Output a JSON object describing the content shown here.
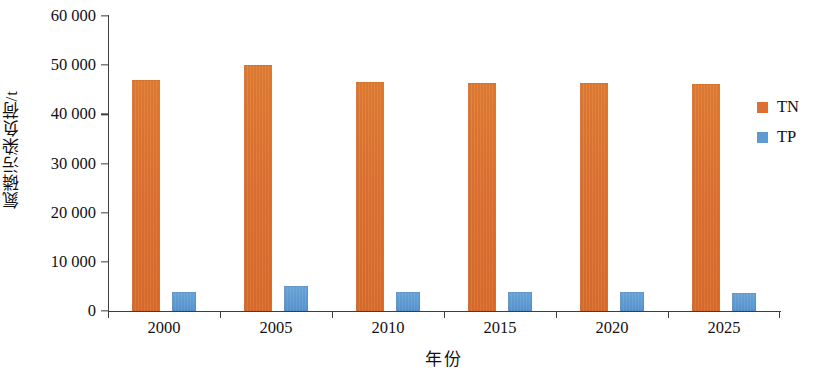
{
  "chart_data": {
    "type": "bar",
    "title": "",
    "xlabel": "年份",
    "ylabel": "氮磷污染负荷/t",
    "categories": [
      "2000",
      "2005",
      "2010",
      "2015",
      "2020",
      "2025"
    ],
    "series": [
      {
        "name": "TN",
        "color": "#dd7030",
        "values": [
          47000,
          50100,
          46500,
          46400,
          46300,
          46200
        ]
      },
      {
        "name": "TP",
        "color": "#5e9bd3",
        "values": [
          3900,
          5000,
          3900,
          3900,
          3800,
          3700
        ]
      }
    ],
    "ylim": [
      0,
      60000
    ],
    "ytick_values": [
      0,
      10000,
      20000,
      30000,
      40000,
      50000,
      60000
    ],
    "ytick_labels": [
      "0",
      "10 000",
      "20 000",
      "30 000",
      "40 000",
      "50 000",
      "60 000"
    ],
    "grid": false,
    "legend_position": "right"
  },
  "axes": {
    "y_title": "氮磷污染负荷/t",
    "x_title": "年份"
  },
  "legend": {
    "items": [
      {
        "label": "TN",
        "color": "#dd7030"
      },
      {
        "label": "TP",
        "color": "#5e9bd3"
      }
    ]
  }
}
